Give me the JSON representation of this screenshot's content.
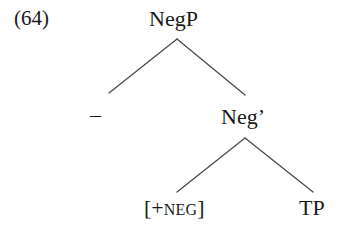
{
  "figure": {
    "example_number": "(64)",
    "type": "syntax-tree",
    "line_color": "#4a4a4a",
    "text_color": "#1a1a1a",
    "background_color": "#ffffff"
  },
  "tree": {
    "root": {
      "label": "NegP",
      "name": "node-negp"
    },
    "specifier": {
      "label": "–",
      "name": "node-empty-specifier"
    },
    "intermediate": {
      "label": "Neg’",
      "name": "node-neg-bar"
    },
    "head": {
      "bracket_open": "[",
      "plus": "+",
      "feature": "NEG",
      "bracket_close": "]",
      "name": "node-neg-feature"
    },
    "complement": {
      "label": "TP",
      "name": "node-tp"
    }
  }
}
